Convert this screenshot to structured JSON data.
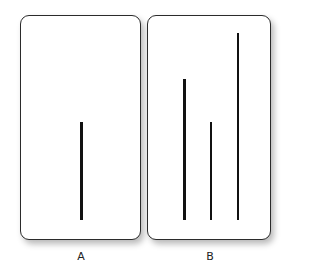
{
  "figure": {
    "cards": [
      {
        "id": "A",
        "label": "A",
        "lines": [
          {
            "name": "standard-line",
            "length_px": 98
          }
        ]
      },
      {
        "id": "B",
        "label": "B",
        "lines": [
          {
            "name": "comparison-line-1",
            "length_px": 141
          },
          {
            "name": "comparison-line-2",
            "length_px": 98
          },
          {
            "name": "comparison-line-3",
            "length_px": 187
          }
        ]
      }
    ],
    "colors": {
      "line": "#111111",
      "card_border": "#2b2b2b",
      "card_fill": "#ffffff",
      "label": "#222222"
    }
  }
}
